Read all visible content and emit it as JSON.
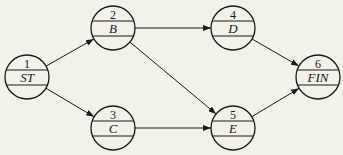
{
  "diagram": {
    "type": "network-diagram",
    "colors": {
      "background": "#f2f1ea",
      "stroke": "#1a1a1a"
    },
    "nodes": [
      {
        "id": "1",
        "number": "1",
        "label": "ST",
        "cx": 27,
        "cy": 77
      },
      {
        "id": "2",
        "number": "2",
        "label": "B",
        "cx": 113,
        "cy": 28
      },
      {
        "id": "3",
        "number": "3",
        "label": "C",
        "cx": 113,
        "cy": 128
      },
      {
        "id": "4",
        "number": "4",
        "label": "D",
        "cx": 233,
        "cy": 28
      },
      {
        "id": "5",
        "number": "5",
        "label": "E",
        "cx": 233,
        "cy": 128
      },
      {
        "id": "6",
        "number": "6",
        "label": "FIN",
        "cx": 318,
        "cy": 77
      }
    ],
    "edges": [
      {
        "from": "1",
        "to": "2"
      },
      {
        "from": "1",
        "to": "3"
      },
      {
        "from": "2",
        "to": "4"
      },
      {
        "from": "2",
        "to": "5"
      },
      {
        "from": "3",
        "to": "5"
      },
      {
        "from": "4",
        "to": "6"
      },
      {
        "from": "5",
        "to": "6"
      }
    ]
  }
}
